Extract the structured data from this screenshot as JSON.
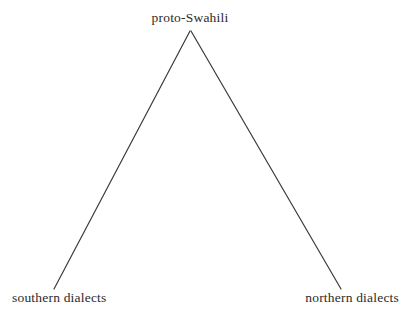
{
  "diagram": {
    "type": "language-family-tree",
    "background_color": "#ffffff",
    "line_color": "#3a3a3a",
    "text_color": "#2b2b2b",
    "nodes": {
      "root": {
        "label": "proto-Swahili",
        "x": 190,
        "y": 31
      },
      "left_leaf": {
        "label": "southern dialects",
        "x": 54,
        "y": 289
      },
      "right_leaf": {
        "label": "northern dialects",
        "x": 341,
        "y": 289
      }
    },
    "edges": [
      {
        "name": "root-to-southern",
        "x1": 190,
        "y1": 31,
        "x2": 54,
        "y2": 289
      },
      {
        "name": "root-to-northern",
        "x1": 191,
        "y1": 31,
        "x2": 341,
        "y2": 289
      }
    ]
  }
}
